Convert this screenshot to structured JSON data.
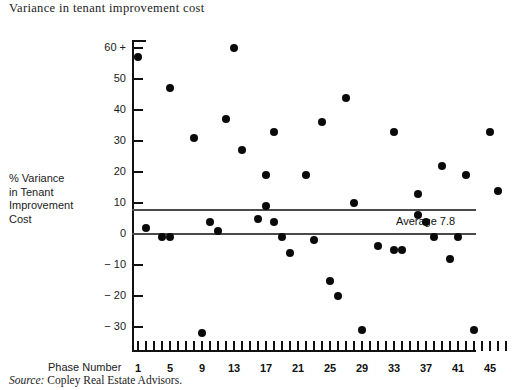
{
  "title": "Variance in tenant improvement cost",
  "source": {
    "label": "Source:",
    "text": "Copley Real Estate Advisors."
  },
  "axis_titles": {
    "y": "% Variance in Tenant Improvement Cost",
    "y_lines": [
      "% Variance",
      "in Tenant",
      "Improvement",
      "Cost"
    ],
    "x": "Phase Number"
  },
  "annotations": {
    "average_label": "Average 7.8",
    "average_value": 7.8
  },
  "colors": {
    "axis": "#111111",
    "point": "#0a0a0a",
    "reference_line": "#4a4a4a",
    "background": "#ffffff"
  },
  "chart_data": {
    "type": "scatter",
    "title": "Variance in tenant improvement cost",
    "xlabel": "Phase Number",
    "ylabel": "% Variance in Tenant Improvement Cost",
    "xlim": [
      0,
      48
    ],
    "ylim": [
      -35,
      62
    ],
    "grid": false,
    "legend": null,
    "x_ticks_minor_step": 1,
    "x_tick_labels": [
      "1",
      "5",
      "9",
      "13",
      "17",
      "21",
      "25",
      "29",
      "33",
      "37",
      "41",
      "45"
    ],
    "x_tick_values": [
      1,
      5,
      9,
      13,
      17,
      21,
      25,
      29,
      33,
      37,
      41,
      45
    ],
    "y_tick_labels": [
      "60 +",
      "50",
      "40",
      "30",
      "20",
      "10",
      "0",
      "− 10",
      "− 20",
      "− 30"
    ],
    "y_tick_values": [
      60,
      50,
      40,
      30,
      20,
      10,
      0,
      -10,
      -20,
      -30
    ],
    "reference_lines": [
      {
        "name": "zero",
        "value": 0
      },
      {
        "name": "average",
        "value": 7.8,
        "label": "Average 7.8"
      }
    ],
    "points": [
      {
        "x": 1,
        "y": 57
      },
      {
        "x": 2,
        "y": 2
      },
      {
        "x": 4,
        "y": -1
      },
      {
        "x": 5,
        "y": 47
      },
      {
        "x": 5,
        "y": -1
      },
      {
        "x": 8,
        "y": 31
      },
      {
        "x": 9,
        "y": -32
      },
      {
        "x": 10,
        "y": 4
      },
      {
        "x": 11,
        "y": 1
      },
      {
        "x": 12,
        "y": 37
      },
      {
        "x": 13,
        "y": 60
      },
      {
        "x": 14,
        "y": 27
      },
      {
        "x": 16,
        "y": 5
      },
      {
        "x": 17,
        "y": 9
      },
      {
        "x": 17,
        "y": 19
      },
      {
        "x": 18,
        "y": 33
      },
      {
        "x": 18,
        "y": 4
      },
      {
        "x": 19,
        "y": -1
      },
      {
        "x": 20,
        "y": -6
      },
      {
        "x": 22,
        "y": 19
      },
      {
        "x": 23,
        "y": -2
      },
      {
        "x": 24,
        "y": 36
      },
      {
        "x": 25,
        "y": -15
      },
      {
        "x": 26,
        "y": -20
      },
      {
        "x": 27,
        "y": 44
      },
      {
        "x": 28,
        "y": 10
      },
      {
        "x": 29,
        "y": -31
      },
      {
        "x": 31,
        "y": -4
      },
      {
        "x": 33,
        "y": 33
      },
      {
        "x": 33,
        "y": -5
      },
      {
        "x": 34,
        "y": -5
      },
      {
        "x": 36,
        "y": 13
      },
      {
        "x": 36,
        "y": 6
      },
      {
        "x": 37,
        "y": 4
      },
      {
        "x": 38,
        "y": -1
      },
      {
        "x": 39,
        "y": 22
      },
      {
        "x": 40,
        "y": -8
      },
      {
        "x": 41,
        "y": -1
      },
      {
        "x": 42,
        "y": 19
      },
      {
        "x": 43,
        "y": -31
      },
      {
        "x": 45,
        "y": 33
      },
      {
        "x": 46,
        "y": 14
      }
    ]
  }
}
